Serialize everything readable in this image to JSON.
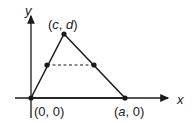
{
  "diagram": {
    "axes": {
      "x_label": "x",
      "y_label": "y"
    },
    "points": {
      "origin": "(0, 0)",
      "apex_open": "(",
      "apex_c": "c",
      "apex_sep": ", ",
      "apex_d": "d",
      "apex_close": ")",
      "base_open": "(",
      "base_a": "a",
      "base_rest": ", 0)"
    },
    "colors": {
      "stroke": "#1a1a1a",
      "background": "#ffffff"
    }
  }
}
